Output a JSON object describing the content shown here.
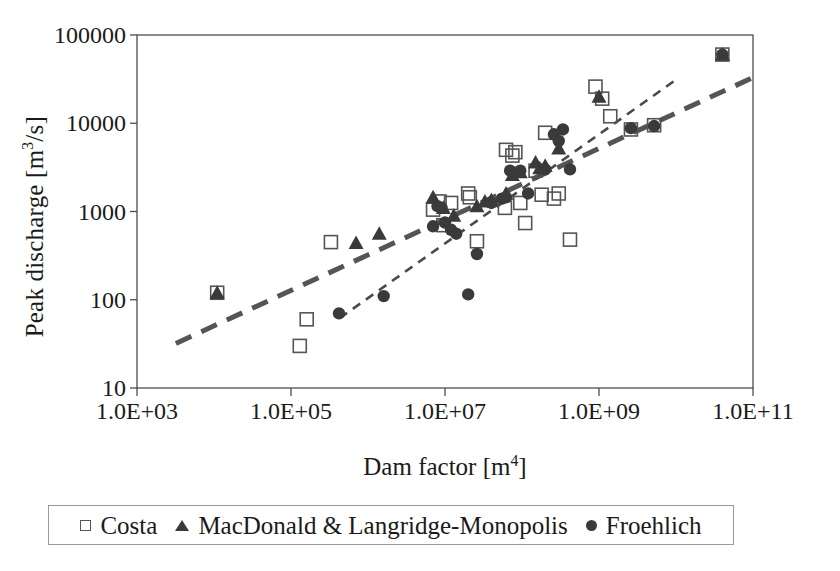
{
  "chart_data": {
    "type": "scatter",
    "title": "",
    "xlabel": "Dam factor [m^4]",
    "xlabel_base": "Dam factor [m",
    "xlabel_exp": "4",
    "xlabel_tail": "]",
    "ylabel": "Peak discharge [m^3/s]",
    "ylabel_base": "Peak discharge [m",
    "ylabel_exp": "3",
    "ylabel_tail": "/s]",
    "xscale": "log",
    "yscale": "log",
    "xlim": [
      1000,
      100000000000
    ],
    "ylim": [
      10,
      100000
    ],
    "grid": false,
    "legend_position": "bottom",
    "xticklabels": [
      "1.0E+03",
      "1.0E+05",
      "1.0E+07",
      "1.0E+09",
      "1.0E+11"
    ],
    "xtickvalues": [
      1000,
      100000,
      10000000,
      1000000000,
      100000000000
    ],
    "yticklabels": [
      "10",
      "100",
      "1000",
      "10000",
      "100000"
    ],
    "ytickvalues": [
      10,
      100,
      1000,
      10000,
      100000
    ],
    "series": [
      {
        "name": "Costa",
        "marker": "open-square",
        "color": "#555555",
        "points": [
          [
            11000,
            120
          ],
          [
            160000,
            60
          ],
          [
            130000,
            30
          ],
          [
            330000,
            450
          ],
          [
            7000000,
            1050
          ],
          [
            8500000,
            1300
          ],
          [
            9500000,
            700
          ],
          [
            12000000,
            1250
          ],
          [
            20000000,
            1600
          ],
          [
            21000000,
            1450
          ],
          [
            26000000,
            460
          ],
          [
            60000000,
            1100
          ],
          [
            62000000,
            5000
          ],
          [
            75000000,
            4300
          ],
          [
            82000000,
            4700
          ],
          [
            95000000,
            1250
          ],
          [
            110000000,
            740
          ],
          [
            150000000,
            2900
          ],
          [
            180000000,
            1550
          ],
          [
            200000000,
            7800
          ],
          [
            260000000,
            1400
          ],
          [
            300000000,
            1600
          ],
          [
            420000000,
            480
          ],
          [
            900000000,
            26000
          ],
          [
            1100000000,
            19000
          ],
          [
            1400000000,
            12000
          ],
          [
            2600000000,
            8500
          ],
          [
            5200000000,
            9500
          ],
          [
            40000000000.0,
            60000
          ]
        ]
      },
      {
        "name": "MacDonald & Langridge-Monopolis",
        "marker": "filled-triangle",
        "color": "#3a3a3a",
        "points": [
          [
            11000,
            120
          ],
          [
            700000,
            440
          ],
          [
            1400000,
            560
          ],
          [
            7000000,
            1450
          ],
          [
            9500000,
            1100
          ],
          [
            13000000,
            900
          ],
          [
            26000000,
            1150
          ],
          [
            33000000,
            1300
          ],
          [
            40000000,
            1350
          ],
          [
            62000000,
            1600
          ],
          [
            75000000,
            2600
          ],
          [
            95000000,
            2800
          ],
          [
            150000000,
            3600
          ],
          [
            170000000,
            3100
          ],
          [
            200000000,
            3300
          ],
          [
            300000000,
            5200
          ],
          [
            1000000000,
            20000
          ],
          [
            40000000000.0,
            60000
          ]
        ]
      },
      {
        "name": "Froehlich",
        "marker": "filled-circle",
        "color": "#3a3a3a",
        "points": [
          [
            420000,
            70
          ],
          [
            1600000,
            110
          ],
          [
            7000000,
            680
          ],
          [
            8000000,
            1150
          ],
          [
            9000000,
            1100
          ],
          [
            10000000,
            750
          ],
          [
            12000000,
            620
          ],
          [
            14000000,
            560
          ],
          [
            20000000,
            115
          ],
          [
            26000000,
            330
          ],
          [
            40000000,
            1250
          ],
          [
            55000000,
            1400
          ],
          [
            62000000,
            1450
          ],
          [
            70000000,
            2900
          ],
          [
            95000000,
            2900
          ],
          [
            120000000,
            1600
          ],
          [
            200000000,
            3000
          ],
          [
            260000000,
            7500
          ],
          [
            300000000,
            6300
          ],
          [
            340000000,
            8500
          ],
          [
            420000000,
            3000
          ],
          [
            2600000000,
            8800
          ],
          [
            5200000000,
            9300
          ],
          [
            40000000000.0,
            60000
          ]
        ]
      }
    ],
    "trendlines": [
      {
        "name": "upper-long-dash",
        "style": "long-dash",
        "color": "#555555",
        "width": 5,
        "from": [
          3200,
          32
        ],
        "to": [
          100000000000.0,
          33000
        ]
      },
      {
        "name": "lower-short-dash",
        "style": "short-dash",
        "color": "#4a4a4a",
        "width": 2.6,
        "from": [
          430000,
          62
        ],
        "to": [
          11000000000.0,
          33000
        ]
      }
    ]
  },
  "legend": {
    "entries": [
      {
        "label": "Costa",
        "marker": "open-square"
      },
      {
        "label": "MacDonald & Langridge-Monopolis",
        "marker": "filled-triangle"
      },
      {
        "label": "Froehlich",
        "marker": "filled-circle"
      }
    ]
  }
}
